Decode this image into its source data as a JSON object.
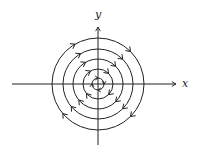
{
  "diagram": {
    "type": "phase-portrait",
    "center": {
      "x": 98,
      "y": 84
    },
    "axes": {
      "x_label": "x",
      "y_label": "y"
    },
    "orbits": [
      {
        "radius": 6,
        "direction": "clockwise"
      },
      {
        "radius": 15,
        "direction": "clockwise"
      },
      {
        "radius": 25,
        "direction": "clockwise"
      },
      {
        "radius": 35,
        "direction": "clockwise"
      },
      {
        "radius": 46,
        "direction": "clockwise"
      }
    ],
    "colors": {
      "stroke": "#222222",
      "background": "#ffffff"
    }
  }
}
